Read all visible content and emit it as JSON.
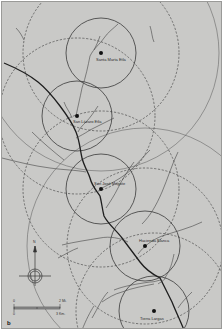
{
  "figure": {
    "panel_label": "b",
    "background_color": "#c9c9c7",
    "line_color": "#3a3a3a",
    "river_color": "#1e1e1e"
  },
  "sites": [
    {
      "name": "Santa Marta Etla",
      "x": 100,
      "y": 52,
      "inner_r": 34,
      "outer_r": 78
    },
    {
      "name": "San Lázaro Etla",
      "x": 76,
      "y": 115,
      "inner_r": 34,
      "outer_r": 78
    },
    {
      "name": "San José Mogote",
      "x": 100,
      "y": 188,
      "inner_r": 34,
      "outer_r": 78
    },
    {
      "name": "Hacienda Blanca",
      "x": 144,
      "y": 245,
      "inner_r": 34,
      "outer_r": 78
    },
    {
      "name": "Tierra Largas",
      "x": 153,
      "y": 310,
      "inner_r": 34,
      "outer_r": 78
    }
  ],
  "north_arrow": {
    "label": "N"
  },
  "scale_bar": {
    "top_left_label": "0",
    "top_right_label": "2 Mi.",
    "bottom_left_label": "0",
    "bottom_right_label": "3 Km."
  }
}
